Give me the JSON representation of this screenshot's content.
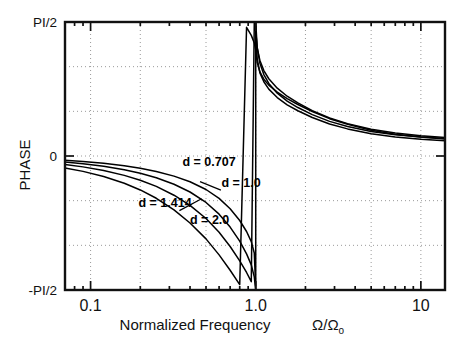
{
  "chart_data": {
    "type": "line",
    "title": "",
    "xlabel": "Normalized Frequency",
    "xlabel_symbol": "Ω/Ω",
    "xlabel_symbol_sub": "o",
    "ylabel": "PHASE",
    "xscale": "log",
    "xlim": [
      0.07,
      14.0
    ],
    "ylim": [
      -1.5707963,
      1.5707963
    ],
    "grid": true,
    "grid_style": "dotted",
    "legend_position": "inline-annotations",
    "xticks": [
      0.1,
      1.0,
      10.0
    ],
    "xtick_labels": [
      "0.1",
      "1.0",
      "10"
    ],
    "yticks": [
      1.5707963,
      0,
      -1.5707963
    ],
    "ytick_labels": [
      "PI/2",
      "0",
      "-PI/2"
    ],
    "x_gridlines": [
      0.2,
      0.5,
      2.0,
      5.0
    ],
    "y_gridlines": [
      1.0471976,
      0.5235988,
      0,
      -0.5235988,
      -1.0471976
    ],
    "annotations": [
      {
        "text": "d = 0.707",
        "x": 0.36,
        "y": -0.12,
        "leader": false
      },
      {
        "text": "d = 1.0",
        "x": 0.62,
        "y": -0.36,
        "leader": true
      },
      {
        "text": "d = 1.414",
        "x": 0.195,
        "y": -0.6,
        "leader": true
      },
      {
        "text": "d = 2.0",
        "x": 0.4,
        "y": -0.8,
        "leader": false
      }
    ],
    "series": [
      {
        "name": "d = 0.707",
        "damping": 0.707,
        "x": [
          0.07,
          0.09,
          0.12,
          0.16,
          0.2,
          0.25,
          0.32,
          0.4,
          0.5,
          0.6,
          0.7,
          0.8,
          0.88,
          0.94,
          0.98,
          0.999,
          1.001,
          1.02,
          1.06,
          1.12,
          1.2,
          1.35,
          1.55,
          1.8,
          2.2,
          2.8,
          3.6,
          5.0,
          7.0,
          10.0,
          14.0
        ],
        "y": [
          -0.0496,
          -0.0638,
          -0.0852,
          -0.114,
          -0.1432,
          -0.1806,
          -0.2359,
          -0.302,
          -0.3927,
          -0.4973,
          -0.6178,
          -0.7558,
          -0.8852,
          -1.0035,
          -1.137,
          -1.521,
          -1.6206,
          -1.9967,
          -2.1669,
          -2.2716,
          -2.3576,
          -2.4564,
          -2.5416,
          -2.6114,
          -2.6901,
          -2.7668,
          -2.8239,
          -2.8815,
          -2.9195,
          -2.9462,
          -2.9639
        ]
      },
      {
        "name": "d = 1.0",
        "damping": 1.0,
        "x": [
          0.07,
          0.09,
          0.12,
          0.16,
          0.2,
          0.25,
          0.32,
          0.4,
          0.5,
          0.6,
          0.7,
          0.8,
          0.88,
          0.94,
          0.98,
          0.999,
          1.001,
          1.02,
          1.06,
          1.12,
          1.2,
          1.35,
          1.55,
          1.8,
          2.2,
          2.8,
          3.6,
          5.0,
          7.0,
          10.0,
          14.0
        ],
        "y": [
          -0.0701,
          -0.0902,
          -0.1205,
          -0.1611,
          -0.202,
          -0.2544,
          -0.3314,
          -0.422,
          -0.5445,
          -0.6816,
          -0.8333,
          -0.9987,
          -1.1468,
          -1.2757,
          -1.4165,
          -1.562,
          -1.5796,
          -1.8645,
          -2.0542,
          -2.1875,
          -2.2911,
          -2.4047,
          -2.4984,
          -2.5735,
          -2.6565,
          -2.736,
          -2.7947,
          -2.8535,
          -2.8921,
          -2.9192,
          -2.9371
        ]
      },
      {
        "name": "d = 1.414",
        "damping": 1.414,
        "x": [
          0.07,
          0.09,
          0.12,
          0.16,
          0.2,
          0.25,
          0.32,
          0.4,
          0.5,
          0.6,
          0.7,
          0.8,
          0.88,
          0.94,
          0.98,
          0.999,
          1.001,
          1.02,
          1.06,
          1.12,
          1.2,
          1.35,
          1.55,
          1.8,
          2.2,
          2.8,
          3.6,
          5.0,
          7.0,
          10.0,
          14.0
        ],
        "y": [
          -0.0991,
          -0.1275,
          -0.1703,
          -0.2272,
          -0.2842,
          -0.3564,
          -0.46,
          -0.5793,
          -0.7328,
          -0.8948,
          -1.0614,
          -1.2287,
          -1.3653,
          -1.4733,
          -1.58,
          -1.6718,
          -1.6825,
          -1.8706,
          -2.0212,
          -2.1397,
          -2.236,
          -2.3462,
          -2.4408,
          -2.5194,
          -2.609,
          -2.6966,
          -2.762,
          -2.8281,
          -2.8721,
          -2.9031,
          -2.9237
        ]
      },
      {
        "name": "d = 2.0",
        "damping": 2.0,
        "x": [
          0.07,
          0.09,
          0.12,
          0.16,
          0.2,
          0.25,
          0.32,
          0.4,
          0.5,
          0.6,
          0.7,
          0.8,
          0.88,
          0.94,
          0.98,
          0.999,
          1.001,
          1.02,
          1.06,
          1.12,
          1.2,
          1.35,
          1.55,
          1.8,
          2.2,
          2.8,
          3.6,
          5.0,
          7.0,
          10.0,
          14.0
        ],
        "y": [
          -0.1401,
          -0.1802,
          -0.2403,
          -0.3195,
          -0.398,
          -0.4956,
          -0.6323,
          -0.7854,
          -0.9716,
          -1.1593,
          -1.339,
          -1.507,
          -1.6326,
          -1.7273,
          -1.8162,
          -1.89,
          -1.8984,
          -2.043,
          -2.155,
          -2.241,
          -2.311,
          -2.3937,
          -2.47,
          -2.5377,
          -2.6196,
          -2.7039,
          -2.7697,
          -2.839,
          -2.8863,
          -2.9197,
          -2.942
        ]
      }
    ],
    "note": "Phase of a second-order resonance; y values stored as continuous unwrapped phase in radians (range -pi..0) and rendered wrapped into [-PI/2, +PI/2] with a jump at Omega/Omega_o = 1."
  },
  "rendering": {
    "plot_left": 65,
    "plot_right": 445,
    "plot_top": 22,
    "plot_bottom": 290,
    "colors": {
      "background": "#ffffff",
      "axis": "#111111",
      "grid": "#9a9a9a",
      "curve": "#000000"
    }
  }
}
